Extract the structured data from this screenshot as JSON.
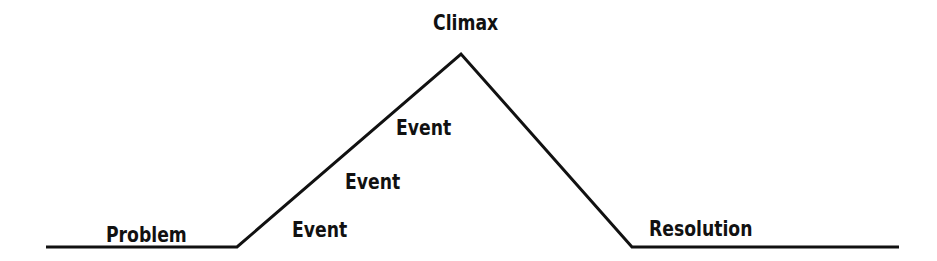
{
  "diagram": {
    "type": "plot-mountain",
    "line_color": "#111111",
    "labels": {
      "climax": "Climax",
      "event_top": "Event",
      "event_middle": "Event",
      "event_bottom": "Event",
      "problem": "Problem",
      "resolution": "Resolution"
    }
  }
}
